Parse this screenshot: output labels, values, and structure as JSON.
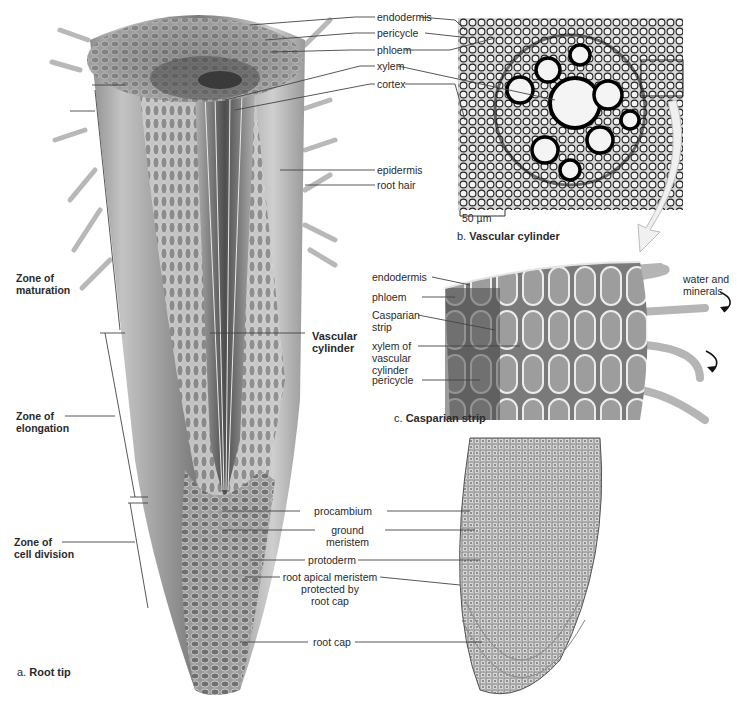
{
  "figure": {
    "panel_a": {
      "letter": "a.",
      "title": "Root tip",
      "zones": [
        {
          "line1": "Zone of",
          "line2": "maturation"
        },
        {
          "line1": "Zone of",
          "line2": "elongation"
        },
        {
          "line1": "Zone of",
          "line2": "cell division"
        }
      ],
      "top_labels": [
        "endodermis",
        "pericycle",
        "phloem",
        "xylem",
        "cortex",
        "epidermis",
        "root hair"
      ],
      "vascular_cylinder": {
        "line1": "Vascular",
        "line2": "cylinder"
      },
      "tip_labels": [
        {
          "lines": [
            "procambium"
          ]
        },
        {
          "lines": [
            "ground",
            "meristem"
          ]
        },
        {
          "lines": [
            "protoderm"
          ]
        },
        {
          "lines": [
            "root apical meristem",
            "protected by",
            "root cap"
          ]
        },
        {
          "lines": [
            "root cap"
          ]
        }
      ]
    },
    "panel_b": {
      "letter": "b.",
      "title": "Vascular cylinder",
      "scale_bar": "50 µm"
    },
    "panel_c": {
      "letter": "c.",
      "title": "Casparian strip",
      "labels": [
        {
          "lines": [
            "endodermis"
          ]
        },
        {
          "lines": [
            "phloem"
          ]
        },
        {
          "lines": [
            "Casparian",
            "strip"
          ]
        },
        {
          "lines": [
            "xylem of",
            "vascular",
            "cylinder"
          ]
        },
        {
          "lines": [
            "pericycle"
          ]
        }
      ],
      "flow_label": {
        "line1": "water and",
        "line2": "minerals"
      }
    },
    "colors": {
      "background": "#ffffff",
      "tissue_light": "#d9d9d9",
      "tissue_mid": "#a8a8a8",
      "tissue_dark": "#5e5e5e",
      "leader_line": "#444444"
    }
  }
}
